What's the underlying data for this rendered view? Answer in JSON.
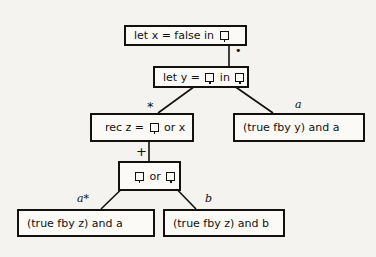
{
  "diagram": {
    "nodes": [
      {
        "id": "n1",
        "parts": [
          "let x = false in ",
          "hole"
        ]
      },
      {
        "id": "n2",
        "parts": [
          "let y = ",
          "hole",
          " in ",
          "hole"
        ]
      },
      {
        "id": "n3",
        "parts": [
          "rec z = ",
          "hole",
          " or x"
        ]
      },
      {
        "id": "n4",
        "parts": [
          "(true fby y) and a"
        ]
      },
      {
        "id": "n5",
        "parts": [
          "hole",
          " or ",
          "hole"
        ]
      },
      {
        "id": "n6",
        "parts": [
          "(true fby z) and a"
        ]
      },
      {
        "id": "n7",
        "parts": [
          "(true fby z) and b"
        ]
      }
    ],
    "n1": {
      "t1": "let x = false in"
    },
    "n2": {
      "t1": "let y =",
      "t2": "in"
    },
    "n3": {
      "t1": "rec z =",
      "t2": "or x"
    },
    "n4": {
      "t1": "(true fby y) and a"
    },
    "n5": {
      "t1": "or"
    },
    "n6": {
      "t1": "(true fby z) and a"
    },
    "n7": {
      "t1": "(true fby z) and b"
    },
    "edges": [
      {
        "from": "n1",
        "to": "n2",
        "label": "•"
      },
      {
        "from": "n2",
        "to": "n3",
        "label": "*"
      },
      {
        "from": "n2",
        "to": "n4",
        "label": "a"
      },
      {
        "from": "n3",
        "to": "n5",
        "label": "+"
      },
      {
        "from": "n5",
        "to": "n6",
        "label": "a*"
      },
      {
        "from": "n5",
        "to": "n7",
        "label": "b"
      }
    ],
    "edge_labels": {
      "e12": "•",
      "e23": "*",
      "e24": "a",
      "e35": "+",
      "e56": "a*",
      "e57": "b"
    }
  }
}
